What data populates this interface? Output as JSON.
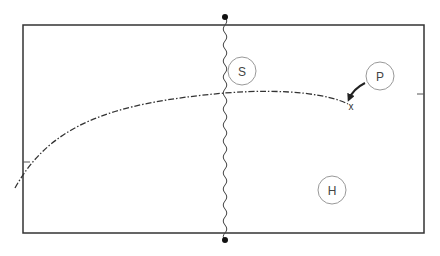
{
  "diagram": {
    "type": "court-play-diagram",
    "court": {
      "x": 23,
      "y": 25,
      "width": 401,
      "height": 208,
      "stroke": "#333333"
    },
    "net": {
      "x": 225,
      "top_post_y": 17,
      "bottom_post_y": 240,
      "style": "wavy"
    },
    "tick_marks": [
      {
        "side": "left",
        "y": 162
      },
      {
        "side": "right",
        "y": 94
      }
    ],
    "players": [
      {
        "id": "S",
        "label": "S",
        "cx": 242,
        "cy": 71,
        "r": 14
      },
      {
        "id": "P",
        "label": "P",
        "cx": 380,
        "cy": 76,
        "r": 14
      },
      {
        "id": "H",
        "label": "H",
        "cx": 332,
        "cy": 190,
        "r": 14
      }
    ],
    "trajectory": {
      "style": "dash-dot",
      "start": [
        15,
        188
      ],
      "end": [
        348,
        104
      ]
    },
    "target_marker": {
      "label": "x",
      "x": 351,
      "y": 107
    },
    "movement_arrow": {
      "from": "P",
      "to": "x"
    }
  }
}
